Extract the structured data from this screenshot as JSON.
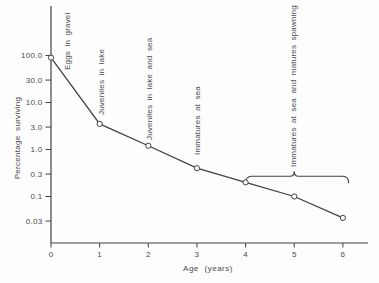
{
  "figure": {
    "background": "#fdfdfd",
    "ink_color": "#424242"
  },
  "chart_data": {
    "type": "line",
    "title": "",
    "xlabel": "Age (years)",
    "ylabel": "Percentage surviving",
    "y_scale": "log",
    "grid": false,
    "marker": "open-circle",
    "x": [
      0,
      1,
      2,
      3,
      4,
      5,
      6
    ],
    "y": [
      90,
      3.5,
      1.2,
      0.4,
      0.2,
      0.1,
      0.035
    ],
    "x_ticks": [
      "0",
      "1",
      "2",
      "3",
      "4",
      "5",
      "6"
    ],
    "y_tick_values": [
      100,
      30,
      10,
      3,
      1,
      0.3,
      0.1,
      0.03
    ],
    "y_tick_labels": [
      "100.0",
      "30.0",
      "10.0",
      "3.0",
      "1.0",
      "0.3",
      "0.1",
      "0.03"
    ],
    "xlim": [
      0,
      6.5
    ],
    "ylim": [
      0.01,
      1000
    ],
    "annotations": [
      {
        "label": "Eggs in gravel",
        "x": 0.35,
        "label_bottom_px": 70
      },
      {
        "label": "Juveniles in lake",
        "x": 1.04,
        "label_bottom_px": 115
      },
      {
        "label": "Juveniles in lake and sea",
        "x": 2.03,
        "label_bottom_px": 140
      },
      {
        "label": "Immatures at sea",
        "x": 3.02,
        "label_bottom_px": 155
      },
      {
        "label": "Immatures at sea and matures spawning",
        "x": 5.0,
        "label_bottom_px": 167
      }
    ],
    "brace": {
      "x_start": 4.0,
      "x_end": 6.12,
      "label_x": 5.0,
      "y_value": 0.27
    }
  }
}
